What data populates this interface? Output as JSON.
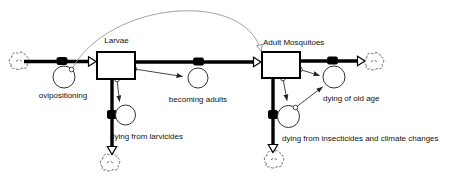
{
  "diagram": {
    "type": "stock-and-flow",
    "stocks": [
      {
        "id": "larvae",
        "label": "Larvae"
      },
      {
        "id": "adult-mosquitoes",
        "label": "Adult Mosquitoes"
      }
    ],
    "flows": [
      {
        "id": "ovipositioning",
        "label": "ovipositioning",
        "from": "cloud",
        "to": "Larvae"
      },
      {
        "id": "becoming-adults",
        "label": "becoming adults",
        "from": "Larvae",
        "to": "Adult Mosquitoes"
      },
      {
        "id": "dying-from-larvicides",
        "label": "dying from larvicides",
        "from": "Larvae",
        "to": "cloud"
      },
      {
        "id": "dying-of-old-age",
        "label": "dying of old age",
        "from": "Adult Mosquitoes",
        "to": "cloud"
      },
      {
        "id": "dying-from-insecticides",
        "label": "dying from insecticides and climate changes",
        "from": "Adult Mosquitoes",
        "to": "cloud"
      }
    ],
    "icons": {
      "clouds": [
        "cloud-source-icon",
        "cloud-sink-right-icon",
        "cloud-sink-bottom-left-icon",
        "cloud-sink-bottom-right-icon"
      ]
    },
    "colors": {
      "background": "#ffffff",
      "stock_fill": "#ffffff",
      "flow_line": "#000000",
      "connector": "#333333",
      "arc_connector": "#999999",
      "text": "#111111"
    }
  }
}
